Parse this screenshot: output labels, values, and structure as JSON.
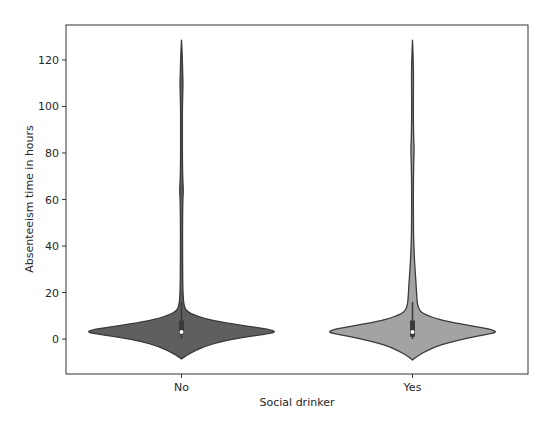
{
  "chart_data": {
    "type": "violin",
    "title": "",
    "xlabel": "Social drinker",
    "ylabel": "Absenteeism time in hours",
    "categories": [
      "No",
      "Yes"
    ],
    "ylim": [
      -15,
      135
    ],
    "yticks": [
      0,
      20,
      40,
      60,
      80,
      100,
      120
    ],
    "grid": false,
    "legend": "none",
    "series": [
      {
        "name": "No",
        "color": "#5f5f5f",
        "outline": "#3a3a3a",
        "max_half_width": 0.41,
        "range": [
          -8.5,
          128.5
        ],
        "quartiles": [
          2,
          8
        ],
        "median": 3,
        "whiskers": [
          0,
          16
        ],
        "density_profile": [
          [
            -8.5,
            0.0
          ],
          [
            -7,
            0.05
          ],
          [
            -5,
            0.14
          ],
          [
            -3,
            0.26
          ],
          [
            -1,
            0.42
          ],
          [
            0.5,
            0.62
          ],
          [
            2,
            0.86
          ],
          [
            3,
            1.0
          ],
          [
            4,
            0.94
          ],
          [
            5,
            0.8
          ],
          [
            6,
            0.62
          ],
          [
            7,
            0.47
          ],
          [
            8,
            0.34
          ],
          [
            9,
            0.24
          ],
          [
            10,
            0.16
          ],
          [
            11,
            0.1
          ],
          [
            12,
            0.06
          ],
          [
            13,
            0.04
          ],
          [
            15,
            0.025
          ],
          [
            18,
            0.018
          ],
          [
            22,
            0.014
          ],
          [
            30,
            0.012
          ],
          [
            40,
            0.011
          ],
          [
            50,
            0.011
          ],
          [
            60,
            0.014
          ],
          [
            64,
            0.02
          ],
          [
            68,
            0.014
          ],
          [
            75,
            0.01
          ],
          [
            90,
            0.009
          ],
          [
            100,
            0.01
          ],
          [
            105,
            0.013
          ],
          [
            110,
            0.016
          ],
          [
            115,
            0.012
          ],
          [
            122,
            0.008
          ],
          [
            128.5,
            0.0
          ]
        ]
      },
      {
        "name": "Yes",
        "color": "#a3a3a3",
        "outline": "#3a3a3a",
        "max_half_width": 0.365,
        "range": [
          -9,
          128.5
        ],
        "quartiles": [
          1,
          8
        ],
        "median": 3,
        "whiskers": [
          0,
          16
        ],
        "density_profile": [
          [
            -9,
            0.0
          ],
          [
            -7.5,
            0.05
          ],
          [
            -5.5,
            0.14
          ],
          [
            -3.5,
            0.26
          ],
          [
            -1.5,
            0.42
          ],
          [
            0.5,
            0.66
          ],
          [
            2,
            0.88
          ],
          [
            3,
            1.0
          ],
          [
            4,
            0.95
          ],
          [
            5,
            0.82
          ],
          [
            6,
            0.65
          ],
          [
            7,
            0.5
          ],
          [
            8,
            0.37
          ],
          [
            9,
            0.27
          ],
          [
            10,
            0.19
          ],
          [
            11,
            0.13
          ],
          [
            12,
            0.09
          ],
          [
            14,
            0.065
          ],
          [
            16,
            0.055
          ],
          [
            20,
            0.048
          ],
          [
            25,
            0.04
          ],
          [
            30,
            0.03
          ],
          [
            35,
            0.022
          ],
          [
            40,
            0.017
          ],
          [
            45,
            0.012
          ],
          [
            50,
            0.011
          ],
          [
            60,
            0.01
          ],
          [
            70,
            0.011
          ],
          [
            78,
            0.016
          ],
          [
            82,
            0.02
          ],
          [
            86,
            0.014
          ],
          [
            95,
            0.01
          ],
          [
            105,
            0.01
          ],
          [
            112,
            0.012
          ],
          [
            120,
            0.009
          ],
          [
            128.5,
            0.0
          ]
        ]
      }
    ]
  }
}
